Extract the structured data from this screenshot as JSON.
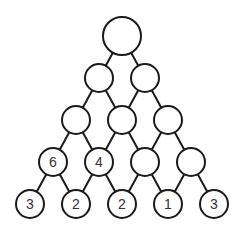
{
  "diagram": {
    "title": "",
    "type": "number-pyramid",
    "rows": [
      [
        ""
      ],
      [
        "",
        ""
      ],
      [
        "",
        "",
        ""
      ],
      [
        "6",
        "4",
        "",
        ""
      ],
      [
        "3",
        "2",
        "2",
        "1",
        "3"
      ]
    ],
    "colors": {
      "stroke": "#1a1a1a",
      "fill": "#ffffff",
      "text": "#333333"
    }
  }
}
